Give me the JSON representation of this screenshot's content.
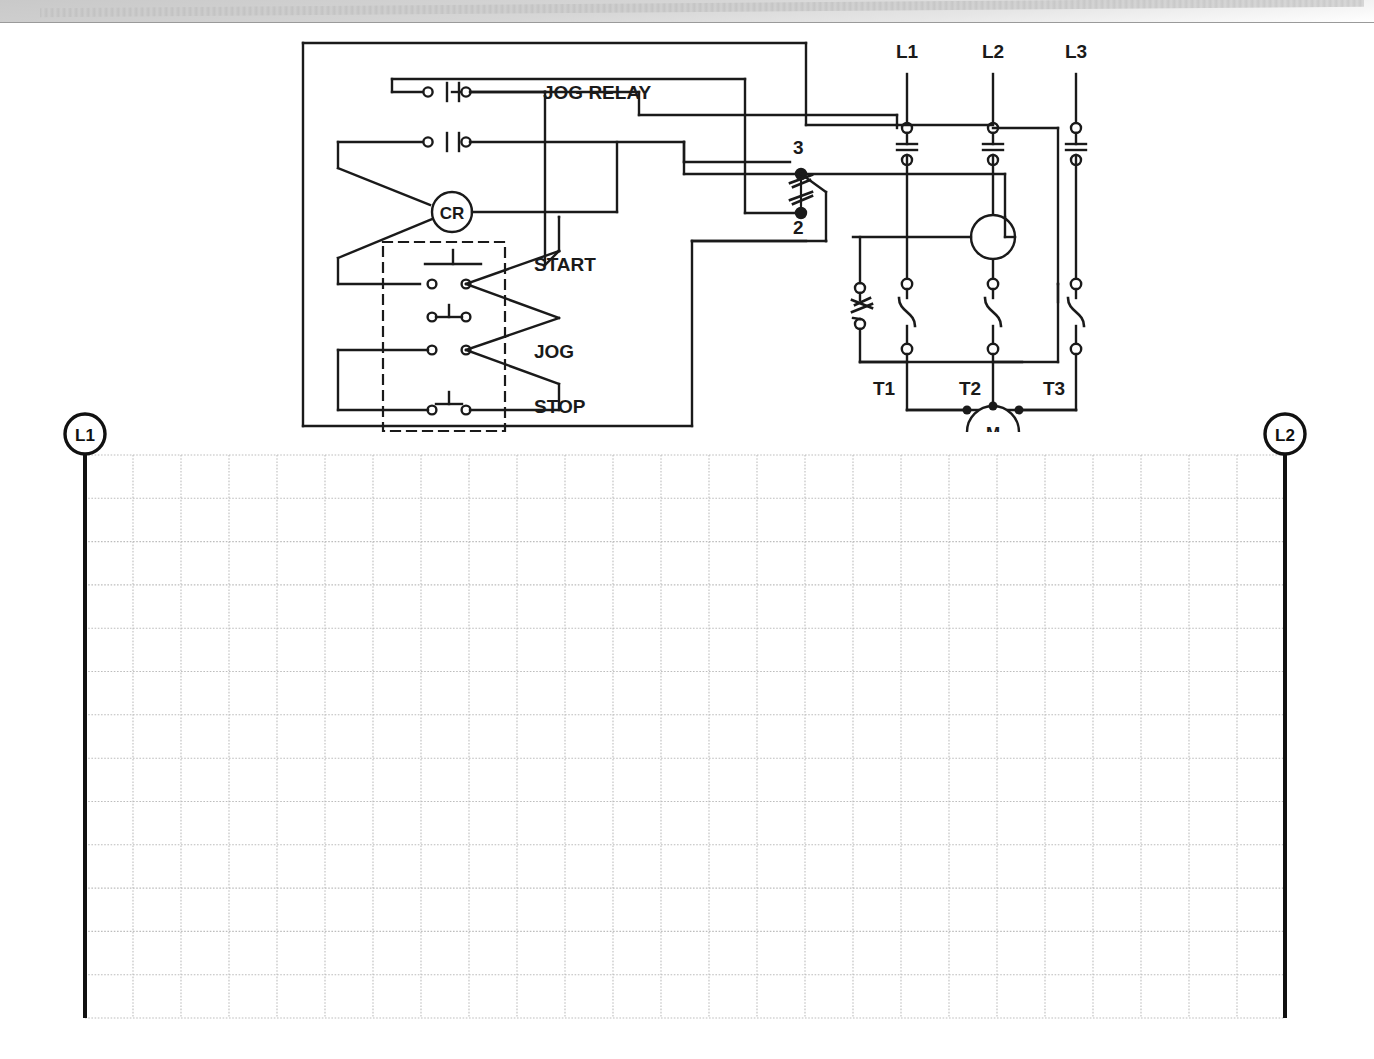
{
  "page": {
    "line_color": "#1a1a1a",
    "grid_color": "#b8b8b8",
    "paper_color": "#ffffff"
  },
  "control_diagram": {
    "name": "jog-control-wiring-diagram",
    "labels": {
      "jog_relay": "JOG RELAY",
      "cr_coil": "CR",
      "start": "START",
      "jog": "JOG",
      "stop": "STOP",
      "selector_terminal_top": "3",
      "selector_terminal_bottom": "2"
    },
    "power_lines": [
      {
        "name": "line-L1",
        "label": "L1"
      },
      {
        "name": "line-L2",
        "label": "L2"
      },
      {
        "name": "line-L3",
        "label": "L3"
      }
    ],
    "motor_terminals": [
      {
        "name": "terminal-T1",
        "label": "T1"
      },
      {
        "name": "terminal-T2",
        "label": "T2"
      },
      {
        "name": "terminal-T3",
        "label": "T3"
      }
    ],
    "motor": {
      "name": "motor-symbol",
      "label": "M"
    },
    "components": [
      {
        "name": "jog-relay-contact-upper",
        "type": "normally-open-contact"
      },
      {
        "name": "jog-relay-contact-lower",
        "type": "normally-open-contact"
      },
      {
        "name": "control-relay-coil",
        "type": "coil",
        "label": "CR"
      },
      {
        "name": "start-pushbutton",
        "type": "normally-open-pushbutton",
        "label": "START"
      },
      {
        "name": "jog-pushbutton",
        "type": "normally-open-pushbutton",
        "label": "JOG"
      },
      {
        "name": "stop-pushbutton",
        "type": "normally-closed-pushbutton",
        "label": "STOP"
      },
      {
        "name": "selector-switch",
        "type": "selector-switch"
      },
      {
        "name": "starter-coil",
        "type": "coil"
      },
      {
        "name": "overload-contact",
        "type": "normally-closed-overload-contact"
      },
      {
        "name": "overload-heater-L1",
        "type": "heater-element"
      },
      {
        "name": "overload-heater-L2",
        "type": "heater-element"
      },
      {
        "name": "overload-heater-L3",
        "type": "heater-element"
      },
      {
        "name": "disconnect-contact-L1",
        "type": "main-contact"
      },
      {
        "name": "disconnect-contact-L2",
        "type": "main-contact"
      },
      {
        "name": "disconnect-contact-L3",
        "type": "main-contact"
      },
      {
        "name": "pushbutton-station-enclosure",
        "type": "dashed-enclosure"
      }
    ]
  },
  "worksheet": {
    "name": "blank-ladder-worksheet",
    "left_rail": {
      "name": "rail-L1",
      "label": "L1"
    },
    "right_rail": {
      "name": "rail-L2",
      "label": "L2"
    },
    "grid": {
      "columns": 25,
      "rows": 13,
      "cell_width": 48,
      "cell_height": 45,
      "style": "dotted"
    }
  }
}
